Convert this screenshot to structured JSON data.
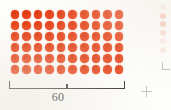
{
  "figure": {
    "name": "dot-array-60",
    "dot_color": "#e8441a",
    "bracket_color": "#3a332e",
    "label_color": "#2b2622",
    "background_color": "#fdfdfb",
    "bracket": {
      "label": "60",
      "has_left_end_tick": true,
      "has_right_end_tick": true,
      "has_center_tick": true
    }
  },
  "partial_right_figure": {
    "name": "partial-neighbouring-figure",
    "dot_color": "#e8441a",
    "visible_dot_count": 6
  },
  "crop_mark": {
    "name": "registration-crop-mark",
    "glyph": "+",
    "color": "#8d8880"
  },
  "chart_data": {
    "type": "scatter",
    "title": "60",
    "subtitle": "",
    "xlabel": "",
    "ylabel": "",
    "rows": 6,
    "columns": 10,
    "total_dots": 60,
    "dot_color": "#e8441a",
    "grid": false,
    "legend": "none",
    "annotations": [
      {
        "text": "60",
        "kind": "bracket-label",
        "position": "below-array",
        "spans": "full width of array"
      }
    ],
    "series": [
      {
        "name": "dot array",
        "values": [
          10,
          10,
          10,
          10,
          10,
          10
        ],
        "note": "dots per row, 6 rows of 10 = 60"
      }
    ]
  }
}
